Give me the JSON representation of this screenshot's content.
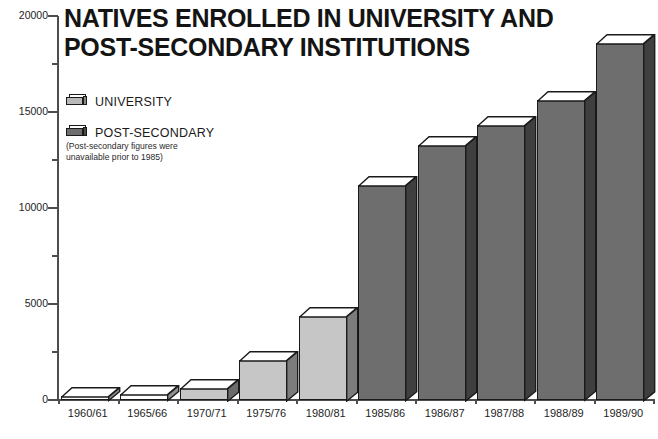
{
  "title": {
    "line1": "NATIVES ENROLLED IN UNIVERSITY AND",
    "line2": "POST-SECONDARY INSTITUTIONS"
  },
  "legend": {
    "items": [
      {
        "label": "UNIVERSITY",
        "color": "#b9b9b9",
        "side_color": "#8a8a8a",
        "swatch_name": "university-swatch"
      },
      {
        "label": "POST-SECONDARY",
        "color": "#6e6e6e",
        "side_color": "#4a4a4a",
        "swatch_name": "post-secondary-swatch"
      }
    ],
    "note_line1": "(Post-secondary figures were",
    "note_line2": "unavailable prior to 1985)"
  },
  "chart_data": {
    "type": "bar",
    "title": "NATIVES ENROLLED IN UNIVERSITY AND POST-SECONDARY INSTITUTIONS",
    "xlabel": "",
    "ylabel": "",
    "ylim": [
      0,
      20000
    ],
    "grid": false,
    "legend_position": "upper-left",
    "y_major_ticks": [
      0,
      5000,
      10000,
      15000,
      20000
    ],
    "y_major_tick_labels": [
      "0",
      "5000",
      "10000",
      "15000",
      "20000"
    ],
    "y_minor_ticks": [
      2500,
      7500,
      12500,
      17500
    ],
    "categories": [
      "1960/61",
      "1965/66",
      "1970/71",
      "1975/76",
      "1980/81",
      "1985/86",
      "1986/87",
      "1987/88",
      "1988/89",
      "1989/90"
    ],
    "values": [
      200,
      300,
      650,
      2100,
      4400,
      11200,
      13300,
      14300,
      15600,
      18600
    ],
    "series_assignment": [
      "UNIVERSITY",
      "UNIVERSITY",
      "UNIVERSITY",
      "UNIVERSITY",
      "UNIVERSITY",
      "POST-SECONDARY",
      "POST-SECONDARY",
      "POST-SECONDARY",
      "POST-SECONDARY",
      "POST-SECONDARY"
    ],
    "bar_colors": [
      "#ffffff",
      "#ffffff",
      "#c6c6c6",
      "#c6c6c6",
      "#c6c6c6",
      "#6e6e6e",
      "#6e6e6e",
      "#6e6e6e",
      "#6e6e6e",
      "#6e6e6e"
    ],
    "bar_side_colors": [
      "#8f8f8f",
      "#8f8f8f",
      "#6b6b6b",
      "#7c7c7c",
      "#7c7c7c",
      "#3f3f3f",
      "#3f3f3f",
      "#3f3f3f",
      "#3f3f3f",
      "#3f3f3f"
    ],
    "bar_top_color": "#ffffff"
  }
}
